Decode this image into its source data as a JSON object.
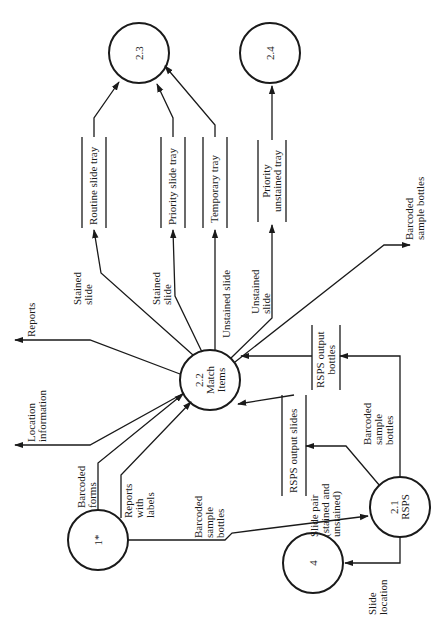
{
  "diagram": {
    "type": "data-flow-diagram",
    "orientation": "rotated-90-ccw",
    "colors": {
      "line": "#1a1a1a",
      "background": "#ffffff"
    },
    "processes": [
      {
        "id": "p23",
        "label": [
          "2.3"
        ]
      },
      {
        "id": "p24",
        "label": [
          "2.4"
        ]
      },
      {
        "id": "p22",
        "label": [
          "2.2",
          "Match",
          "Items"
        ]
      },
      {
        "id": "p1",
        "label": [
          "1*"
        ]
      },
      {
        "id": "p21",
        "label": [
          "2.1",
          "RSPS"
        ]
      },
      {
        "id": "p4",
        "label": [
          "4"
        ]
      }
    ],
    "stores": [
      {
        "id": "routine",
        "label": [
          "Routine slide tray"
        ]
      },
      {
        "id": "priority",
        "label": [
          "Priority slide tray"
        ]
      },
      {
        "id": "temporary",
        "label": [
          "Temporary tray"
        ]
      },
      {
        "id": "priority_unstained",
        "label": [
          "Priority",
          "unstained tray"
        ]
      },
      {
        "id": "rsps_slides",
        "label": [
          "RSPS output slides"
        ]
      },
      {
        "id": "rsps_bottles",
        "label": [
          "RSPS output",
          "bottles"
        ]
      }
    ],
    "flows": [
      {
        "id": "f1",
        "label": [
          "Stained",
          "slide"
        ]
      },
      {
        "id": "f2",
        "label": [
          "Stained",
          "slide"
        ]
      },
      {
        "id": "f3",
        "label": [
          "Unstained slide"
        ]
      },
      {
        "id": "f4",
        "label": [
          "Unstained",
          "slide"
        ]
      },
      {
        "id": "f5",
        "label": [
          "Barcoded",
          "sample bottles"
        ]
      },
      {
        "id": "f6",
        "label": [
          "Reports"
        ]
      },
      {
        "id": "f7",
        "label": [
          "Location",
          "information"
        ]
      },
      {
        "id": "f8",
        "label": [
          "Barcoded",
          "forms"
        ]
      },
      {
        "id": "f9",
        "label": [
          "Reports",
          "with",
          "labels"
        ]
      },
      {
        "id": "f10",
        "label": [
          "Barcoded",
          "sample",
          "bottles"
        ]
      },
      {
        "id": "f11",
        "label": [
          "Slide pair",
          "(stained and",
          "unstained)"
        ]
      },
      {
        "id": "f12",
        "label": [
          "Barcoded",
          "sample",
          "bottles"
        ]
      },
      {
        "id": "f13",
        "label": [
          "Slide",
          "location"
        ]
      }
    ]
  }
}
